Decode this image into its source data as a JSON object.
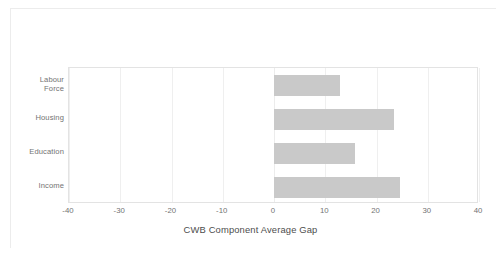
{
  "chart_data": {
    "type": "bar",
    "orientation": "horizontal",
    "title": "",
    "xlabel": "CWB Component Average Gap",
    "ylabel": "",
    "categories": [
      "Labour Force",
      "Housing",
      "Education",
      "Income"
    ],
    "values": [
      12.8,
      23.5,
      15.9,
      24.6
    ],
    "series": [
      {
        "name": "CWB Component Average Gap",
        "values": [
          12.8,
          23.5,
          15.9,
          24.6
        ]
      }
    ],
    "xlim": [
      -40,
      40
    ],
    "xticks": [
      -40,
      -30,
      -20,
      -10,
      0,
      10,
      20,
      30,
      40
    ],
    "xtick_labels": [
      "-40",
      "-30",
      "-20",
      "-10",
      "0",
      "10",
      "20",
      "30",
      "40"
    ],
    "grid": true,
    "grid_axis": "x",
    "legend": false,
    "bar_color": "#c9c9c9",
    "gridline_color": "#efefef",
    "axis_color": "#e3e3e3",
    "tick_label_color": "#737373",
    "axis_title_color": "#4d4d4d",
    "background_color": "#ffffff"
  },
  "category_labels": [
    {
      "line1": "Labour",
      "line2": "Force"
    },
    {
      "line1": "Housing",
      "line2": ""
    },
    {
      "line1": "Education",
      "line2": ""
    },
    {
      "line1": "Income",
      "line2": ""
    }
  ]
}
